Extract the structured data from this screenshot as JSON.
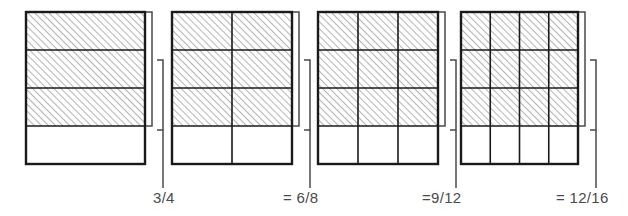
{
  "figure": {
    "colors": {
      "outline": "#1a1a1a",
      "grid_line": "#1a1a1a",
      "hatch": "#7a7a7a",
      "bracket": "#4a4a4a",
      "label_text": "#4a4a4a",
      "background": "#ffffff"
    },
    "hatch": {
      "direction": "forward-slash",
      "spacing_px": 5,
      "line_width_px": 1.1
    }
  },
  "chart_data": {
    "type": "area",
    "xlabel": "",
    "ylabel": "",
    "categories": [
      "3/4",
      "6/8",
      "9/12",
      "12/16"
    ],
    "values": [
      0.75,
      0.75,
      0.75,
      0.75
    ],
    "series": [
      {
        "name": "shaded fraction of area",
        "values": [
          0.75,
          0.75,
          0.75,
          0.75
        ]
      },
      {
        "name": "shaded parts",
        "values": [
          3,
          6,
          9,
          12
        ]
      },
      {
        "name": "total parts",
        "values": [
          4,
          8,
          12,
          16
        ]
      }
    ],
    "legend_position": "none",
    "grid": true,
    "annotations": [
      "3/4",
      "= 6/8",
      "=9/12",
      "= 12/16"
    ]
  },
  "panels": [
    {
      "id": "panel-1",
      "columns": 1,
      "rows": 4,
      "shaded_rows": 3,
      "shaded_parts": 3,
      "total_parts": 4,
      "fraction": "3/4",
      "label": "3/4",
      "rect": {
        "x": 26,
        "y": 12,
        "w": 119,
        "h": 152
      },
      "bracket_inner": {
        "x": 152,
        "y1": 12,
        "y2": 126,
        "tick": 6
      },
      "bracket_outer": {
        "x": 163,
        "y1": 60,
        "y2": 130,
        "tick": 6
      },
      "leader": {
        "x": 163,
        "y1": 130,
        "y2": 188
      },
      "label_pos": {
        "x": 153,
        "y": 203
      }
    },
    {
      "id": "panel-2",
      "columns": 2,
      "rows": 4,
      "shaded_rows": 3,
      "shaded_parts": 6,
      "total_parts": 8,
      "fraction": "6/8",
      "label": "= 6/8",
      "rect": {
        "x": 172,
        "y": 12,
        "w": 120,
        "h": 152
      },
      "bracket_inner": {
        "x": 299,
        "y1": 12,
        "y2": 126,
        "tick": 6
      },
      "bracket_outer": {
        "x": 310,
        "y1": 60,
        "y2": 130,
        "tick": 6
      },
      "leader": {
        "x": 310,
        "y1": 130,
        "y2": 188
      },
      "label_pos": {
        "x": 283,
        "y": 203
      }
    },
    {
      "id": "panel-3",
      "columns": 3,
      "rows": 4,
      "shaded_rows": 3,
      "shaded_parts": 9,
      "total_parts": 12,
      "fraction": "9/12",
      "label": "=9/12",
      "rect": {
        "x": 318,
        "y": 12,
        "w": 120,
        "h": 152
      },
      "bracket_inner": {
        "x": 445,
        "y1": 12,
        "y2": 126,
        "tick": 6
      },
      "bracket_outer": {
        "x": 456,
        "y1": 60,
        "y2": 130,
        "tick": 6
      },
      "leader": {
        "x": 456,
        "y1": 130,
        "y2": 188
      },
      "label_pos": {
        "x": 422,
        "y": 203
      }
    },
    {
      "id": "panel-4",
      "columns": 4,
      "rows": 4,
      "shaded_rows": 3,
      "shaded_parts": 12,
      "total_parts": 16,
      "fraction": "12/16",
      "label": "= 12/16",
      "rect": {
        "x": 461,
        "y": 12,
        "w": 117,
        "h": 152
      },
      "bracket_inner": {
        "x": 585,
        "y1": 12,
        "y2": 126,
        "tick": 6
      },
      "bracket_outer": {
        "x": 596,
        "y1": 60,
        "y2": 130,
        "tick": 6
      },
      "leader": {
        "x": 596,
        "y1": 130,
        "y2": 188
      },
      "label_pos": {
        "x": 556,
        "y": 203
      }
    }
  ]
}
